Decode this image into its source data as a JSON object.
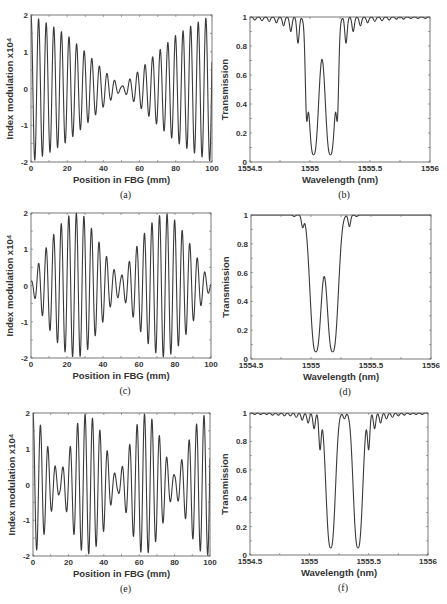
{
  "figure": {
    "panels": [
      "a",
      "b",
      "c",
      "d",
      "e",
      "f"
    ]
  },
  "chart_data": [
    {
      "id": "a",
      "type": "line",
      "caption": "(a)",
      "title": "",
      "xlabel": "Position in FBG (mm)",
      "ylabel": "Index modulation x10⁴",
      "xlim": [
        0,
        100
      ],
      "ylim": [
        -2,
        2
      ],
      "xticks": [
        0,
        20,
        40,
        60,
        80,
        100
      ],
      "yticks": [
        -2,
        -1,
        0,
        1,
        2
      ],
      "grid": false,
      "frame": {
        "left": 31,
        "right": 212,
        "top": 15,
        "bottom": 162
      },
      "description": "Oscillation with period ~4.2 mm; envelope decreases linearly from 2 at x=0 to ~0 at x=50 then increases to 2 at x=100",
      "model": {
        "kind": "modulated",
        "period": 4.2,
        "envelope": "v",
        "amplitude": 2
      },
      "series": [
        {
          "name": "index modulation",
          "envelope_points": [
            [
              0,
              2
            ],
            [
              10,
              1.75
            ],
            [
              20,
              1.45
            ],
            [
              30,
              1.0
            ],
            [
              40,
              0.5
            ],
            [
              50,
              0.05
            ],
            [
              60,
              0.5
            ],
            [
              70,
              1.0
            ],
            [
              80,
              1.45
            ],
            [
              90,
              1.75
            ],
            [
              100,
              2
            ]
          ]
        }
      ]
    },
    {
      "id": "b",
      "type": "line",
      "caption": "(b)",
      "title": "",
      "xlabel": "Wavelength (nm)",
      "ylabel": "Transmission",
      "xlim": [
        1554.5,
        1556
      ],
      "ylim": [
        0,
        1
      ],
      "xticks": [
        1554.5,
        1555,
        1555.5,
        1556
      ],
      "xtick_labels": [
        "1554.5",
        "1555",
        "1555.5",
        "1556"
      ],
      "yticks": [
        0,
        0.2,
        0.4,
        0.6,
        0.8,
        1
      ],
      "ytick_labels": [
        "0",
        "0.2",
        "0.4",
        "0.6",
        "0.8",
        "1"
      ],
      "grid": false,
      "frame": {
        "left": 250,
        "right": 430,
        "top": 17,
        "bottom": 162
      },
      "description": "Dual-channel transmission spectrum with two deep dips",
      "model": {
        "kind": "spectrum",
        "dips": [
          {
            "center": 1555.03,
            "depth": 0.95,
            "width": 0.055
          },
          {
            "center": 1555.17,
            "depth": 0.95,
            "width": 0.055
          }
        ],
        "sidelobes": [
          [
            1554.97,
            0.58
          ],
          [
            1555.23,
            0.58
          ],
          [
            1554.9,
            0.82
          ],
          [
            1555.3,
            0.82
          ],
          [
            1554.84,
            0.9
          ],
          [
            1555.36,
            0.9
          ],
          [
            1554.78,
            0.94
          ],
          [
            1555.42,
            0.94
          ],
          [
            1554.72,
            0.96
          ],
          [
            1555.48,
            0.96
          ],
          [
            1554.66,
            0.97
          ],
          [
            1555.54,
            0.97
          ],
          [
            1554.6,
            0.975
          ],
          [
            1555.6,
            0.975
          ],
          [
            1554.54,
            0.98
          ],
          [
            1555.66,
            0.98
          ],
          [
            1555.72,
            0.985
          ],
          [
            1555.78,
            0.985
          ],
          [
            1555.84,
            0.99
          ],
          [
            1555.9,
            0.99
          ],
          [
            1555.96,
            0.99
          ]
        ]
      },
      "series": [
        {
          "name": "transmission",
          "key_points": [
            [
              1555.03,
              0.05
            ],
            [
              1555.1,
              1.0
            ],
            [
              1555.17,
              0.05
            ],
            [
              1554.97,
              0.58
            ],
            [
              1555.23,
              0.58
            ],
            [
              1554.9,
              0.82
            ],
            [
              1555.3,
              0.82
            ]
          ]
        }
      ]
    },
    {
      "id": "c",
      "type": "line",
      "caption": "(c)",
      "title": "",
      "xlabel": "Position in FBG (mm)",
      "ylabel": "Index modulation x10⁴",
      "xlim": [
        0,
        100
      ],
      "ylim": [
        -2,
        2
      ],
      "xticks": [
        0,
        20,
        40,
        60,
        80,
        100
      ],
      "yticks": [
        -2,
        -1,
        0,
        1,
        2
      ],
      "grid": false,
      "frame": {
        "left": 31,
        "right": 211,
        "top": 213,
        "bottom": 358
      },
      "description": "Two sinc-like lobes centered near 25 mm and 75 mm with period ~4.2 mm",
      "model": {
        "kind": "modulated",
        "period": 4.2,
        "envelope": "sinc2",
        "amplitude": 2
      },
      "series": [
        {
          "name": "index modulation",
          "envelope_points": [
            [
              0,
              0.1
            ],
            [
              5,
              0.7
            ],
            [
              10,
              1.2
            ],
            [
              15,
              1.6
            ],
            [
              20,
              1.9
            ],
            [
              25,
              2.0
            ],
            [
              30,
              1.9
            ],
            [
              35,
              1.45
            ],
            [
              40,
              1.0
            ],
            [
              45,
              0.5
            ],
            [
              50,
              0.25
            ],
            [
              55,
              0.7
            ],
            [
              60,
              1.2
            ],
            [
              65,
              1.6
            ],
            [
              70,
              1.9
            ],
            [
              75,
              2.0
            ],
            [
              80,
              1.8
            ],
            [
              85,
              1.45
            ],
            [
              90,
              1.0
            ],
            [
              95,
              0.5
            ],
            [
              100,
              0.1
            ]
          ]
        }
      ]
    },
    {
      "id": "d",
      "type": "line",
      "caption": "(d)",
      "title": "",
      "xlabel": "Wavelength (nm)",
      "ylabel": "Transmission",
      "xlim": [
        1554.5,
        1556
      ],
      "ylim": [
        0,
        1
      ],
      "xticks": [
        1554.5,
        1555,
        1555.5,
        1556
      ],
      "xtick_labels": [
        "1554.5",
        "1555",
        "1555.5",
        "1556"
      ],
      "yticks": [
        0,
        0.2,
        0.4,
        0.6,
        0.8,
        1
      ],
      "ytick_labels": [
        "0",
        "0.2",
        "0.4",
        "0.6",
        "0.8",
        "1"
      ],
      "grid": false,
      "frame": {
        "left": 251,
        "right": 431,
        "top": 215,
        "bottom": 359
      },
      "description": "Dual-channel spectrum with flat-top dips and suppressed sidelobes",
      "model": {
        "kind": "spectrum",
        "dips": [
          {
            "center": 1555.04,
            "depth": 0.95,
            "width": 0.06
          },
          {
            "center": 1555.18,
            "depth": 0.95,
            "width": 0.06
          }
        ],
        "sidelobes": [
          [
            1554.93,
            0.92
          ],
          [
            1555.32,
            0.92
          ],
          [
            1554.86,
            0.99
          ],
          [
            1555.38,
            0.99
          ]
        ]
      },
      "series": [
        {
          "name": "transmission",
          "key_points": [
            [
              1555.04,
              0.05
            ],
            [
              1555.11,
              1.0
            ],
            [
              1555.18,
              0.05
            ],
            [
              1554.93,
              0.92
            ],
            [
              1555.32,
              0.92
            ]
          ]
        }
      ]
    },
    {
      "id": "e",
      "type": "line",
      "caption": "(e)",
      "title": "",
      "xlabel": "Position in FBG (mm)",
      "ylabel": "Index modulation x10⁴",
      "xlim": [
        0,
        100
      ],
      "ylim": [
        -2,
        2
      ],
      "xticks": [
        0,
        20,
        40,
        60,
        80,
        100
      ],
      "yticks": [
        -2,
        -1,
        0,
        1,
        2
      ],
      "grid": false,
      "frame": {
        "left": 33,
        "right": 210,
        "top": 413,
        "bottom": 556
      },
      "description": "Three-lobe beating pattern with nodes near 15, 47 and 80 mm; period ~4.2 mm",
      "model": {
        "kind": "modulated",
        "period": 4.2,
        "envelope": "three",
        "amplitude": 2
      },
      "series": [
        {
          "name": "index modulation",
          "envelope_points": [
            [
              0,
              2.0
            ],
            [
              5,
              1.6
            ],
            [
              10,
              0.8
            ],
            [
              15,
              0.25
            ],
            [
              20,
              0.9
            ],
            [
              25,
              1.7
            ],
            [
              30,
              2.0
            ],
            [
              35,
              1.8
            ],
            [
              40,
              1.3
            ],
            [
              45,
              0.4
            ],
            [
              48,
              0.2
            ],
            [
              52,
              0.7
            ],
            [
              57,
              1.5
            ],
            [
              62,
              2.0
            ],
            [
              67,
              1.85
            ],
            [
              72,
              1.3
            ],
            [
              77,
              0.55
            ],
            [
              80,
              0.25
            ],
            [
              85,
              0.8
            ],
            [
              90,
              1.5
            ],
            [
              95,
              1.9
            ],
            [
              100,
              2.0
            ]
          ]
        }
      ]
    },
    {
      "id": "f",
      "type": "line",
      "caption": "(f)",
      "title": "",
      "xlabel": "Wavelength (nm)",
      "ylabel": "Transmission",
      "xlim": [
        1554.5,
        1556
      ],
      "ylim": [
        0,
        1
      ],
      "xticks": [
        1554.5,
        1555,
        1555.5,
        1556
      ],
      "xtick_labels": [
        "1554.5",
        "1555",
        "1555.5",
        "1556"
      ],
      "yticks": [
        0,
        0.2,
        0.4,
        0.6,
        0.8,
        1
      ],
      "ytick_labels": [
        "0",
        "0.2",
        "0.4",
        "0.6",
        "0.8",
        "1"
      ],
      "grid": false,
      "frame": {
        "left": 250,
        "right": 428,
        "top": 413,
        "bottom": 555
      },
      "description": "Dual-channel spectrum with wider channel spacing (~0.23 nm)",
      "model": {
        "kind": "spectrum",
        "dips": [
          {
            "center": 1555.18,
            "depth": 0.95,
            "width": 0.05
          },
          {
            "center": 1555.41,
            "depth": 0.95,
            "width": 0.05
          }
        ],
        "sidelobes": [
          [
            1555.09,
            0.75
          ],
          [
            1555.5,
            0.75
          ],
          [
            1555.04,
            0.89
          ],
          [
            1555.55,
            0.89
          ],
          [
            1554.99,
            0.93
          ],
          [
            1555.6,
            0.93
          ],
          [
            1554.94,
            0.95
          ],
          [
            1555.65,
            0.96
          ],
          [
            1554.89,
            0.97
          ],
          [
            1555.7,
            0.97
          ],
          [
            1554.84,
            0.98
          ],
          [
            1555.75,
            0.98
          ],
          [
            1554.79,
            0.98
          ],
          [
            1555.8,
            0.985
          ],
          [
            1554.74,
            0.985
          ],
          [
            1555.85,
            0.99
          ],
          [
            1554.69,
            0.985
          ],
          [
            1555.9,
            0.99
          ],
          [
            1554.64,
            0.99
          ],
          [
            1555.95,
            0.99
          ],
          [
            1554.59,
            0.99
          ],
          [
            1554.54,
            0.99
          ],
          [
            1555.295,
            0.96
          ]
        ]
      },
      "series": [
        {
          "name": "transmission",
          "key_points": [
            [
              1555.18,
              0.05
            ],
            [
              1555.295,
              1.0
            ],
            [
              1555.41,
              0.05
            ],
            [
              1555.09,
              0.75
            ],
            [
              1555.5,
              0.75
            ]
          ]
        }
      ]
    }
  ]
}
